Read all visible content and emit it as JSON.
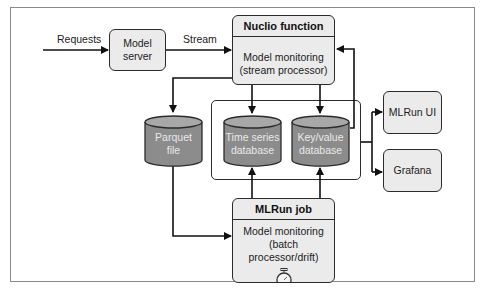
{
  "diagram": {
    "edge_labels": {
      "requests": "Requests",
      "stream": "Stream"
    },
    "nodes": {
      "model_server": "Model server",
      "nuclio": {
        "header": "Nuclio function",
        "line1": "Model monitoring",
        "line2": "(stream processor)"
      },
      "parquet": {
        "line1": "Parquet",
        "line2": "file"
      },
      "timeseries": {
        "line1": "Time series",
        "line2": "database"
      },
      "keyvalue": {
        "line1": "Key/value",
        "line2": "database"
      },
      "mlrun_ui": "MLRun UI",
      "grafana": "Grafana",
      "mlrun_job": {
        "header": "MLRun job",
        "line1": "Model monitoring",
        "line2": "(batch processor/drift)",
        "icon": "stopwatch-icon"
      }
    },
    "edges": [
      {
        "from": "external",
        "to": "model_server",
        "label": "Requests"
      },
      {
        "from": "model_server",
        "to": "nuclio",
        "label": "Stream"
      },
      {
        "from": "nuclio",
        "to": "parquet"
      },
      {
        "from": "nuclio",
        "to": "timeseries"
      },
      {
        "from": "nuclio",
        "to": "keyvalue"
      },
      {
        "from": "keyvalue",
        "to": "nuclio"
      },
      {
        "from": "parquet",
        "to": "mlrun_job"
      },
      {
        "from": "mlrun_job",
        "to": "timeseries"
      },
      {
        "from": "mlrun_job",
        "to": "keyvalue"
      },
      {
        "from": "db_group",
        "to": "mlrun_ui"
      },
      {
        "from": "db_group",
        "to": "grafana"
      }
    ],
    "colors": {
      "box_fill": "#ebebeb",
      "cylinder_fill": "#8c8c8c",
      "cylinder_top": "#a8a8a8",
      "stroke": "#2b2b2b",
      "cylinder_text": "#e9e9e9"
    }
  }
}
